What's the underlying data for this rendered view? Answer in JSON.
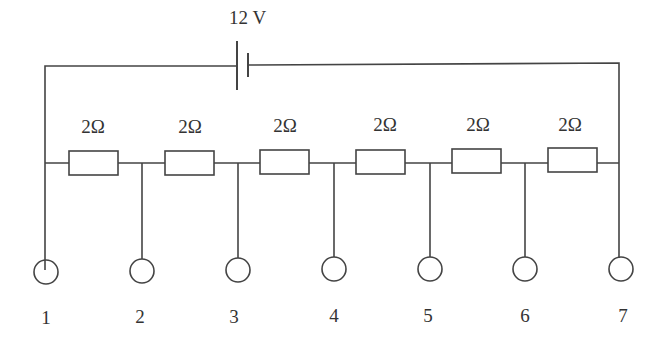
{
  "diagram": {
    "type": "circuit",
    "battery": {
      "label": "12 V"
    },
    "resistors": [
      {
        "label": "2Ω"
      },
      {
        "label": "2Ω"
      },
      {
        "label": "2Ω"
      },
      {
        "label": "2Ω"
      },
      {
        "label": "2Ω"
      },
      {
        "label": "2Ω"
      }
    ],
    "terminals": [
      {
        "label": "1"
      },
      {
        "label": "2"
      },
      {
        "label": "3"
      },
      {
        "label": "4"
      },
      {
        "label": "5"
      },
      {
        "label": "6"
      },
      {
        "label": "7"
      }
    ],
    "colors": {
      "stroke": "#444444",
      "text": "#333333"
    }
  }
}
